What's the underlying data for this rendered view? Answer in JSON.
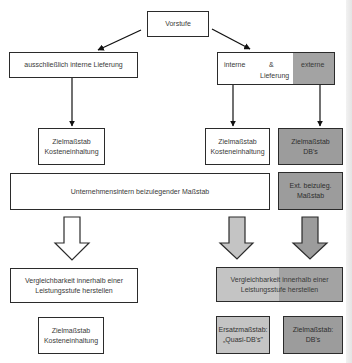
{
  "diagram": {
    "root": {
      "label": "Vorstufe"
    },
    "branch_left": {
      "label": "ausschließlich interne Lieferung"
    },
    "branch_right": {
      "internal_label": "interne",
      "connector_label": "&",
      "delivery_label": "Lieferung",
      "external_label": "externe"
    },
    "level2": {
      "left_target": {
        "label": "Zielmaßstab\nKosteneinhaltung"
      },
      "mid_target": {
        "label": "Zielmaßstab\nKosteneinhaltung"
      },
      "right_target": {
        "label": "Zielmaßstab\nDB's"
      }
    },
    "level3": {
      "internal_measure": {
        "label": "Unternehmensintern beizulegender Maßstab"
      },
      "external_measure": {
        "label": "Ext. beizuleg.\nMaßstab"
      }
    },
    "level4": {
      "left_comparability": {
        "label": "Vergleichbarkeit innerhalb einer\nLeistungsstufe herstellen"
      },
      "right_comparability": {
        "label": "Vergleichbarkeit innerhalb einer\nLeistungsstufe herstellen"
      }
    },
    "level5": {
      "left_target": {
        "label": "Zielmaßstab\nKosteneinhaltung"
      },
      "substitute_target": {
        "label": "Ersatzmaßstab:\n„Quasi-DB's\""
      },
      "db_target": {
        "label": "Zielmaßstab:\nDB's"
      }
    },
    "colors": {
      "white_fill": "#ffffff",
      "light_grey_fill": "#c4c4c4",
      "dark_grey_fill": "#9c9c9c",
      "border": "#2b2b2b"
    }
  }
}
